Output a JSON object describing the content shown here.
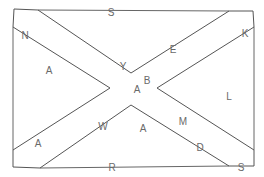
{
  "diagram": {
    "title": "",
    "stroke_color": "#555555",
    "label_color": "#6a6a6a",
    "background": "#ffffff",
    "labels": {
      "top_edge": "S",
      "upper_left_band": "N",
      "left_region": "A",
      "upper_left_diagonal": "Y",
      "upper_right_diagonal": "E",
      "upper_right_band": "K",
      "center_upper": "B",
      "center": "A",
      "right_region": "L",
      "lower_left_region": "A",
      "lower_left_diagonal": "W",
      "lower_center_region": "A",
      "lower_right_diagonal": "M",
      "lower_right_band": "D",
      "bottom_edge": "R",
      "bottom_right_corner": "S"
    }
  }
}
